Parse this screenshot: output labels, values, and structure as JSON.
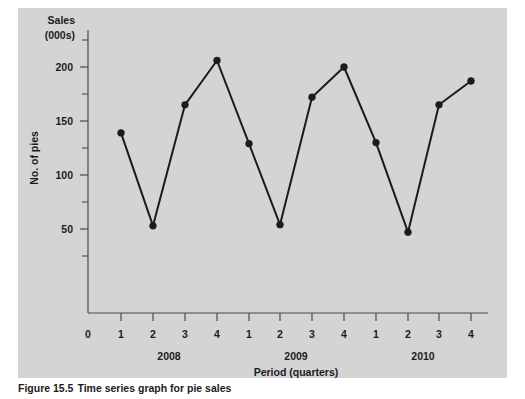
{
  "figure": {
    "caption_label": "Figure 15.5",
    "caption_text": "Time series graph for pie sales",
    "panel_background": "#d4d4d4",
    "page_background": "#ffffff"
  },
  "chart_data": {
    "type": "line",
    "title": "",
    "subtitle": "",
    "xlabel": "Period (quarters)",
    "ylabel": "No. of pies",
    "y_unit_label_line1": "Sales",
    "y_unit_label_line2": "(000s)",
    "categories": [
      "1",
      "2",
      "3",
      "4",
      "1",
      "2",
      "3",
      "4",
      "1",
      "2",
      "3",
      "4"
    ],
    "x_origin_label": "0",
    "group_labels": [
      "2008",
      "2009",
      "2010"
    ],
    "series": [
      {
        "name": "Pie sales",
        "color": "#1b1b1b",
        "values": [
          139,
          53,
          165,
          206,
          129,
          54,
          172,
          200,
          130,
          47,
          165,
          187
        ]
      }
    ],
    "points": [
      {
        "year": "2008",
        "quarter": "1",
        "value": 139
      },
      {
        "year": "2008",
        "quarter": "2",
        "value": 53
      },
      {
        "year": "2008",
        "quarter": "3",
        "value": 165
      },
      {
        "year": "2008",
        "quarter": "4",
        "value": 206
      },
      {
        "year": "2009",
        "quarter": "1",
        "value": 129
      },
      {
        "year": "2009",
        "quarter": "2",
        "value": 54
      },
      {
        "year": "2009",
        "quarter": "3",
        "value": 172
      },
      {
        "year": "2009",
        "quarter": "4",
        "value": 200
      },
      {
        "year": "2010",
        "quarter": "1",
        "value": 130
      },
      {
        "year": "2010",
        "quarter": "2",
        "value": 47
      },
      {
        "year": "2010",
        "quarter": "3",
        "value": 165
      },
      {
        "year": "2010",
        "quarter": "4",
        "value": 187
      }
    ],
    "ylim": [
      0,
      230
    ],
    "y_major_ticks": [
      50,
      100,
      150,
      200
    ],
    "y_minor_ticks": [
      25,
      75,
      125,
      175,
      225
    ],
    "y_tick_labels": [
      "50",
      "100",
      "150",
      "200"
    ],
    "grid": false,
    "legend": false,
    "legend_position": "none",
    "marker": "filled-circle",
    "line_style": "solid"
  }
}
